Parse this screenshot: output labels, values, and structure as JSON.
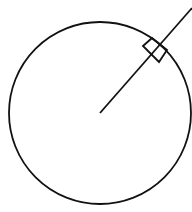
{
  "diagram": {
    "type": "circle-with-tangent-right-angle",
    "stroke_color": "#111111",
    "background": "#ffffff",
    "circle": {
      "cx": 100,
      "cy": 113,
      "r": 91
    },
    "radius_line": {
      "x1": 100,
      "y1": 113,
      "x2": 192,
      "y2": 8
    },
    "right_angle_marker": {
      "points": "143,46 152,38 167,50 159,62"
    }
  }
}
